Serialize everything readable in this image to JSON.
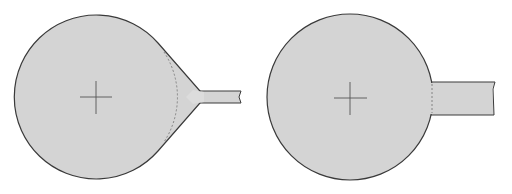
{
  "diagram": {
    "colors": {
      "fill": "#d4d4d4",
      "stroke": "#3a3a3a",
      "dashed": "#7a7a7a",
      "background": "#ffffff"
    },
    "figures": [
      {
        "name": "teardrop-pad",
        "pad_center": [
          96,
          97
        ],
        "pad_radius": 82,
        "trace": {
          "x_start": 200,
          "x_end": 241,
          "y_top": 91,
          "y_bottom": 103
        },
        "teardrop_tip": [
          203,
          97
        ]
      },
      {
        "name": "plain-pad",
        "pad_center": [
          350,
          97
        ],
        "pad_radius": 83,
        "trace": {
          "x_start": 430,
          "x_end": 495,
          "y_top": 82,
          "y_bottom": 115
        }
      }
    ]
  }
}
